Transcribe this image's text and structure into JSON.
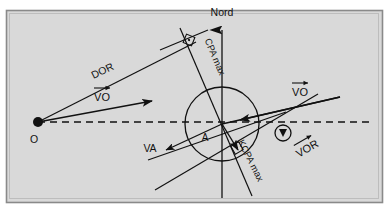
{
  "figure": {
    "kind": "radar-cpa-vector-diagram",
    "background_color": "#d9d9d9",
    "frame_border_color": "#8a8a8a",
    "outer_background_color": "#ffffff",
    "line_color": "#111111",
    "frame": {
      "x": 6,
      "y": 10,
      "width": 376,
      "height": 192
    }
  },
  "labels": {
    "nord": "Nord",
    "dor": "DOR",
    "cpa_max": "CPA max",
    "kcpa_max": "KCPA max",
    "vo_left": "VO",
    "vo_right": "VO",
    "vor": "VOR",
    "va": "VA",
    "point_o": "O",
    "point_a": "A"
  },
  "points": {
    "O": {
      "x": 38,
      "y": 122,
      "label": "O",
      "label_x": 34,
      "label_y": 141,
      "marker": "filled-dot",
      "radius": 5
    },
    "A": {
      "x": 222,
      "y": 124,
      "label": "A",
      "label_x": 203,
      "label_y": 140,
      "marker": "none"
    }
  },
  "circle": {
    "name": "cpa-circle",
    "cx": 222,
    "cy": 124,
    "r": 37
  },
  "axes": {
    "north": {
      "name": "north-axis",
      "x1": 222,
      "y1": 198,
      "x2": 222,
      "y2": 26,
      "arrow": "up",
      "label_x": 222,
      "label_y": 16
    },
    "relative_motion_dashed": {
      "name": "relative-motion-line",
      "x1": 38,
      "y1": 122,
      "x2": 370,
      "y2": 122,
      "dash": "7,5"
    }
  },
  "lines": {
    "dor": {
      "name": "dor-line",
      "x1": 38,
      "y1": 122,
      "x2": 196,
      "y2": 42,
      "label_x": 104,
      "label_y": 72,
      "label_rotation": -26
    },
    "cpa_max": {
      "name": "cpa-max-line",
      "x1": 180,
      "y1": 28,
      "x2": 252,
      "y2": 196,
      "label_x": 198,
      "label_y": 52,
      "label_rotation": 67
    },
    "kcpa_max": {
      "name": "kcpa-max-line",
      "x1": 155,
      "y1": 190,
      "x2": 318,
      "y2": 94,
      "label_x": 240,
      "label_y": 158,
      "label_rotation": -30
    },
    "cpa_perp_tick": {
      "name": "cpa-perpendicular-tick",
      "x1": 160,
      "y1": 50,
      "x2": 208,
      "y2": 30
    },
    "kcpa_cross": {
      "name": "kcpa-cross-line",
      "x1": 148,
      "y1": 160,
      "x2": 286,
      "y2": 112
    }
  },
  "vectors": {
    "vo_left": {
      "name": "vo-left-vector",
      "x1": 38,
      "y1": 122,
      "x2": 152,
      "y2": 101,
      "label_x": 102,
      "label_y": 98
    },
    "vo_right": {
      "name": "vo-right-vector",
      "x1": 222,
      "y1": 124,
      "x2": 340,
      "y2": 97,
      "label_x": 298,
      "label_y": 93
    },
    "vor": {
      "name": "vor-vector",
      "x1": 340,
      "y1": 97,
      "x2": 222,
      "y2": 124,
      "label_x": 304,
      "label_y": 152,
      "label_rotation": -30,
      "marker_circle": {
        "cx": 283,
        "cy": 133,
        "r": 8
      }
    },
    "va": {
      "name": "va-vector",
      "x1": 222,
      "y1": 124,
      "x2": 162,
      "y2": 152,
      "label_x": 150,
      "label_y": 150
    },
    "va_inner": {
      "name": "va-inner-vector",
      "x1": 222,
      "y1": 124,
      "x2": 240,
      "y2": 152
    }
  },
  "right_angle_marks": [
    {
      "name": "right-angle-cpa-max",
      "cx": 189,
      "cy": 40,
      "rotation": 22
    },
    {
      "name": "right-angle-kcpa-max",
      "cx": 237,
      "cy": 148,
      "rotation": -30
    }
  ]
}
